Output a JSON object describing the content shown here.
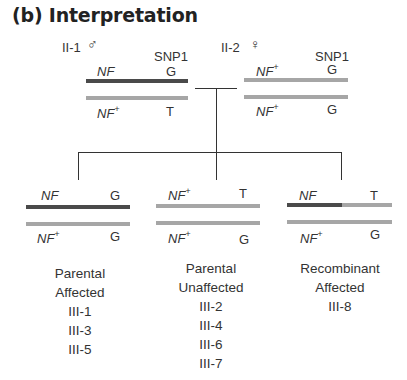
{
  "title": "(b) Interpretation",
  "parents": [
    {
      "id": "II-1",
      "sex_symbol": "♂",
      "marker_label": "SNP1",
      "chromosomes": [
        {
          "allele": "NF",
          "superscript": "",
          "snp": "G",
          "color": "dark"
        },
        {
          "allele": "NF",
          "superscript": "+",
          "snp": "T",
          "color": "light"
        }
      ]
    },
    {
      "id": "II-2",
      "sex_symbol": "♀",
      "marker_label": "SNP1",
      "chromosomes": [
        {
          "allele": "NF",
          "superscript": "+",
          "snp": "G",
          "color": "light"
        },
        {
          "allele": "NF",
          "superscript": "+",
          "snp": "G",
          "color": "light"
        }
      ]
    }
  ],
  "offspring": [
    {
      "chromosomes": [
        {
          "allele": "NF",
          "superscript": "",
          "snp": "G",
          "color": "dark"
        },
        {
          "allele": "NF",
          "superscript": "+",
          "snp": "G",
          "color": "light"
        }
      ],
      "class_line1": "Parental",
      "class_line2": "Affected",
      "individuals": [
        "III-1",
        "III-3",
        "III-5"
      ]
    },
    {
      "chromosomes": [
        {
          "allele": "NF",
          "superscript": "+",
          "snp": "T",
          "color": "light"
        },
        {
          "allele": "NF",
          "superscript": "+",
          "snp": "G",
          "color": "light"
        }
      ],
      "class_line1": "Parental",
      "class_line2": "Unaffected",
      "individuals": [
        "III-2",
        "III-4",
        "III-6",
        "III-7"
      ]
    },
    {
      "chromosomes": [
        {
          "allele": "NF",
          "superscript": "",
          "snp": "T",
          "color": "dark-light-recombinant"
        },
        {
          "allele": "NF",
          "superscript": "+",
          "snp": "G",
          "color": "light"
        }
      ],
      "class_line1": "Recombinant",
      "class_line2": "Affected",
      "individuals": [
        "III-8"
      ]
    }
  ],
  "colors": {
    "dark": "#4a4a4a",
    "light": "#a6a6a6",
    "line": "#333333"
  }
}
